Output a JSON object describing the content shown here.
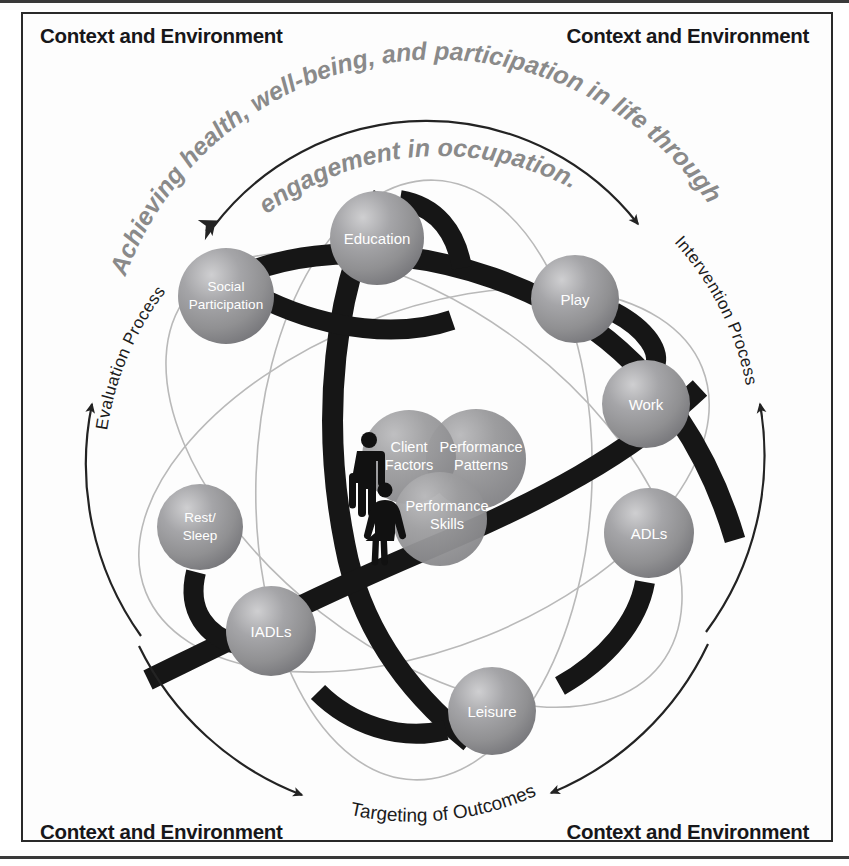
{
  "diagram": {
    "title_arc_line1": "Achieving health, well-being, and participation in life through",
    "title_arc_line2": "engagement in occupation.",
    "corners": {
      "top_left": "Context and Environment",
      "top_right": "Context and Environment",
      "bottom_left": "Context and Environment",
      "bottom_right": "Context and Environment"
    },
    "process_labels": {
      "left": "Evaluation Process",
      "right": "Intervention Process",
      "bottom": "Targeting of Outcomes"
    },
    "occupations": [
      {
        "id": "education",
        "label": "Education",
        "line1": "Education",
        "line2": "",
        "cx": 377,
        "cy": 238,
        "r": 47
      },
      {
        "id": "social-participation",
        "label": "Social Participation",
        "line1": "Social",
        "line2": "Participation",
        "cx": 226,
        "cy": 296,
        "r": 48
      },
      {
        "id": "play",
        "label": "Play",
        "line1": "Play",
        "line2": "",
        "cx": 575,
        "cy": 299,
        "r": 44
      },
      {
        "id": "work",
        "label": "Work",
        "line1": "Work",
        "line2": "",
        "cx": 646,
        "cy": 404,
        "r": 44
      },
      {
        "id": "adls",
        "label": "ADLs",
        "line1": "ADLs",
        "line2": "",
        "cx": 649,
        "cy": 533,
        "r": 45
      },
      {
        "id": "rest-sleep",
        "label": "Rest/Sleep",
        "line1": "Rest/",
        "line2": "Sleep",
        "cx": 200,
        "cy": 527,
        "r": 43
      },
      {
        "id": "iadls",
        "label": "IADLs",
        "line1": "IADLs",
        "line2": "",
        "cx": 271,
        "cy": 631,
        "r": 45
      },
      {
        "id": "leisure",
        "label": "Leisure",
        "line1": "Leisure",
        "line2": "",
        "cx": 492,
        "cy": 711,
        "r": 44
      }
    ],
    "core": [
      {
        "id": "client-factors",
        "label": "Client Factors",
        "line1": "Client",
        "line2": "Factors",
        "cx": 409,
        "cy": 457,
        "r": 47
      },
      {
        "id": "performance-patterns",
        "label": "Performance Patterns",
        "line1": "Performance",
        "line2": "Patterns",
        "cx": 476,
        "cy": 459,
        "r": 50
      },
      {
        "id": "performance-skills",
        "label": "Performance Skills",
        "line1": "Performance",
        "line2": "Skills",
        "cx": 440,
        "cy": 519,
        "r": 47
      }
    ],
    "person_icons": [
      {
        "id": "male-figure",
        "label": "male figure"
      },
      {
        "id": "female-figure",
        "label": "female figure"
      }
    ],
    "colors": {
      "bubble_fill": "#909092",
      "bubble_highlight": "#c9c9cb",
      "bubble_shadow": "#6b6b6e",
      "ribbon": "#161616",
      "orbit_line": "#b8b8b8",
      "arrow": "#232323",
      "arc_text": "#8a8a8a",
      "frame_border": "#2a2a2a",
      "page_background": "#ffffff",
      "label_text": "#ffffff",
      "corner_text": "#17171a"
    }
  }
}
